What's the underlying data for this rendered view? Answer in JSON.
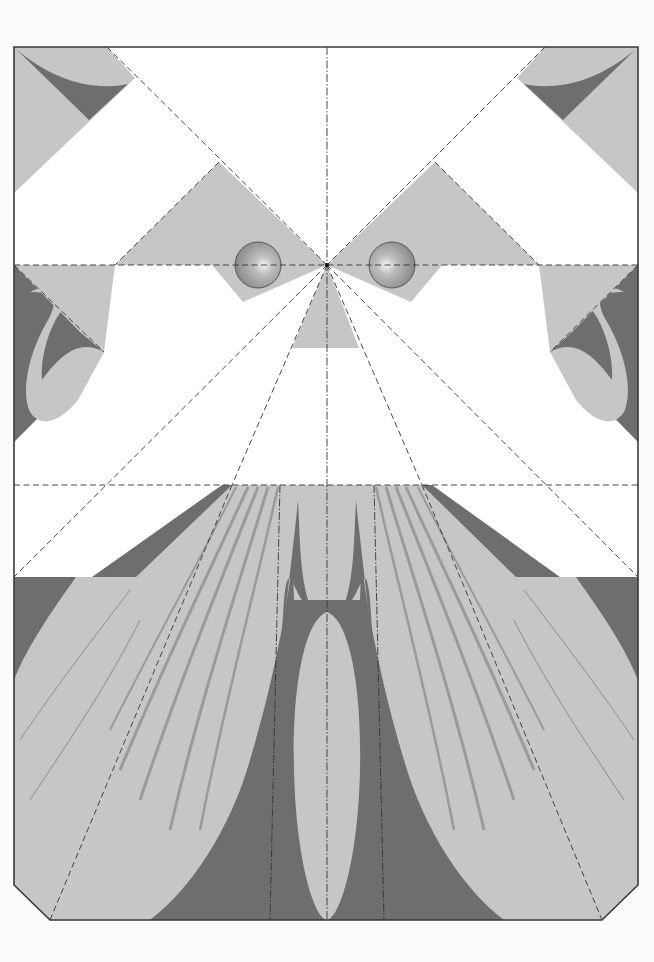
{
  "diagram": {
    "type": "papercraft-template",
    "colors": {
      "paper": "#ffffff",
      "background": "#fbfbfb",
      "light_gray": "#c6c6c6",
      "dark_gray": "#6e6e6e",
      "stripe_gray": "#9a9a9a",
      "cut_line": "#3a3a3a",
      "fold_line": "#333333"
    },
    "sheet": {
      "left": 14,
      "top": 47,
      "right": 638,
      "bottom": 920,
      "corner_bevel": "bottom"
    },
    "fold_lines": {
      "horizontal": [
        265,
        485
      ],
      "vertical_center": 327,
      "vertical_beard": [
        272,
        382
      ]
    },
    "elements": {
      "top_corner_flaps": [
        "left",
        "right"
      ],
      "brow_triangles": [
        "left",
        "right"
      ],
      "eyes": [
        {
          "side": "left",
          "cx": 258,
          "cy": 265,
          "r": 23
        },
        {
          "side": "right",
          "cx": 392,
          "cy": 265,
          "r": 23
        }
      ],
      "nose": {
        "apex": [
          327,
          265
        ],
        "base_y": 348
      },
      "ear_flaps": [
        "left",
        "right"
      ],
      "beard": {
        "stripes_per_side": 7,
        "center_lobe": true
      }
    }
  }
}
